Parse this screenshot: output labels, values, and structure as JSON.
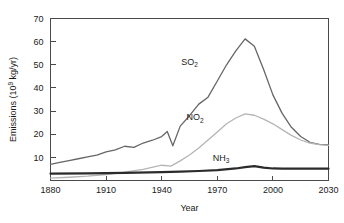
{
  "chart_data": {
    "type": "line",
    "title": "",
    "xlabel": "Year",
    "ylabel": "Emissions (10⁹ kg/yr)",
    "ylabel_main": "Emissions (10",
    "ylabel_exp": "9",
    "ylabel_tail": " kg/yr)",
    "xlim": [
      1880,
      2030
    ],
    "ylim": [
      0,
      70
    ],
    "xticks": [
      1880,
      1910,
      1940,
      1970,
      2000,
      2030
    ],
    "yticks": [
      10,
      20,
      30,
      40,
      50,
      60,
      70
    ],
    "grid": false,
    "legend": "inline-annotations",
    "series": [
      {
        "name": "SO2",
        "label_main": "SO",
        "label_sub": "2",
        "color": "#666666",
        "width": 1.3,
        "label_x": 1955,
        "label_y": 50,
        "x": [
          1880,
          1885,
          1890,
          1895,
          1900,
          1905,
          1910,
          1915,
          1920,
          1925,
          1930,
          1935,
          1940,
          1943,
          1946,
          1950,
          1955,
          1960,
          1965,
          1970,
          1975,
          1980,
          1985,
          1990,
          1995,
          2000,
          2005,
          2010,
          2015,
          2020,
          2025,
          2030
        ],
        "y": [
          7.0,
          7.8,
          8.6,
          9.4,
          10.2,
          11.0,
          12.4,
          13.2,
          14.8,
          14.3,
          16.2,
          17.4,
          19.0,
          21.2,
          15.0,
          23.5,
          28.0,
          33.0,
          36.0,
          43.0,
          50.0,
          56.0,
          61.2,
          58.0,
          48.0,
          37.0,
          29.0,
          23.0,
          19.0,
          16.5,
          15.6,
          15.4
        ]
      },
      {
        "name": "NO2",
        "label_main": "NO",
        "label_sub": "2",
        "color": "#b5b5b5",
        "width": 1.3,
        "label_x": 1958,
        "label_y": 26,
        "x": [
          1880,
          1890,
          1900,
          1910,
          1920,
          1930,
          1940,
          1945,
          1950,
          1955,
          1960,
          1965,
          1970,
          1975,
          1980,
          1985,
          1990,
          1995,
          2000,
          2005,
          2010,
          2015,
          2020,
          2025,
          2030
        ],
        "y": [
          1.0,
          1.4,
          1.9,
          2.6,
          3.6,
          4.8,
          6.6,
          6.2,
          8.5,
          11.0,
          14.0,
          17.5,
          21.0,
          24.5,
          27.0,
          28.8,
          28.2,
          26.5,
          24.5,
          22.0,
          19.5,
          17.5,
          16.2,
          15.5,
          15.2
        ]
      },
      {
        "name": "NH3",
        "label_main": "NH",
        "label_sub": "3",
        "color": "#2b2b2b",
        "width": 2.2,
        "label_x": 1972,
        "label_y": 8.6,
        "x": [
          1880,
          1900,
          1920,
          1940,
          1950,
          1960,
          1970,
          1980,
          1985,
          1990,
          1995,
          2000,
          2005,
          2010,
          2020,
          2030
        ],
        "y": [
          3.0,
          3.1,
          3.3,
          3.6,
          3.8,
          4.1,
          4.5,
          5.2,
          5.8,
          6.2,
          5.6,
          5.2,
          5.1,
          5.1,
          5.1,
          5.1
        ]
      }
    ]
  }
}
